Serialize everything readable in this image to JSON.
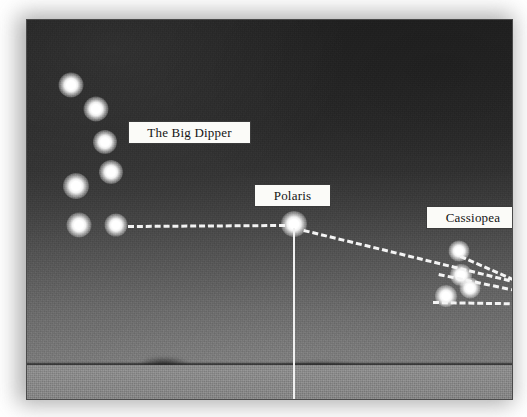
{
  "image": {
    "kind": "night-sky-photograph",
    "subject": "star chart showing how to find Polaris using the Big Dipper and Cassiopea"
  },
  "labels": [
    {
      "id": "big-dipper",
      "text": "The Big Dipper",
      "left": 101,
      "top": 101,
      "width": 123,
      "height": 23
    },
    {
      "id": "polaris",
      "text": "Polaris",
      "left": 227,
      "top": 164,
      "width": 77,
      "height": 23
    },
    {
      "id": "cassiopea",
      "text": "Cassiopea",
      "left": 399,
      "top": 186,
      "width": 94,
      "height": 23
    }
  ],
  "constellations": [
    {
      "name": "The Big Dipper",
      "stars": [
        {
          "name": "star-1",
          "x": 44,
          "y": 65,
          "size": 25
        },
        {
          "name": "star-2",
          "x": 69,
          "y": 89,
          "size": 25
        },
        {
          "name": "star-3",
          "x": 78,
          "y": 122,
          "size": 24
        },
        {
          "name": "star-4",
          "x": 84,
          "y": 152,
          "size": 24
        },
        {
          "name": "star-5",
          "x": 49,
          "y": 166,
          "size": 26
        },
        {
          "name": "star-6",
          "x": 52,
          "y": 205,
          "size": 25
        },
        {
          "name": "star-7",
          "x": 89,
          "y": 205,
          "size": 23
        }
      ]
    },
    {
      "name": "Polaris",
      "stars": [
        {
          "name": "polaris-star",
          "x": 267,
          "y": 204,
          "size": 26
        }
      ]
    },
    {
      "name": "Cassiopea",
      "stars": [
        {
          "name": "cas-1",
          "x": 432,
          "y": 231,
          "size": 21
        },
        {
          "name": "cas-2",
          "x": 434,
          "y": 255,
          "size": 22
        },
        {
          "name": "cas-3",
          "x": 443,
          "y": 268,
          "size": 21
        },
        {
          "name": "cas-4",
          "x": 419,
          "y": 276,
          "size": 22
        }
      ]
    }
  ],
  "pointer_lines": [
    {
      "id": "dipper-to-polaris",
      "x1": 101,
      "y1": 205,
      "x2": 258,
      "y2": 204
    },
    {
      "id": "polaris-to-cassiopea-upper",
      "x1": 277,
      "y1": 209,
      "x2": 527,
      "y2": 270
    },
    {
      "id": "cassiopea-fan-middle",
      "x1": 412,
      "y1": 253,
      "x2": 527,
      "y2": 277
    },
    {
      "id": "cassiopea-fan-lower",
      "x1": 406,
      "y1": 281,
      "x2": 527,
      "y2": 283
    },
    {
      "id": "cassiopea-link-top",
      "x1": 434,
      "y1": 235,
      "x2": 527,
      "y2": 276
    }
  ],
  "plumb_line": {
    "id": "polaris-to-horizon",
    "x": 267,
    "y_top": 208,
    "y_bottom": 381
  },
  "colors": {
    "sky_top": "#232323",
    "sky_horizon": "#7e7e7e",
    "ground": "#8a8a8a",
    "star": "#ffffff",
    "dash": "#f4f4f4",
    "label_bg": "#fbfbf8",
    "label_border": "#3b3b3b",
    "label_text": "#141414",
    "frame_border": "#4a4a4a"
  }
}
